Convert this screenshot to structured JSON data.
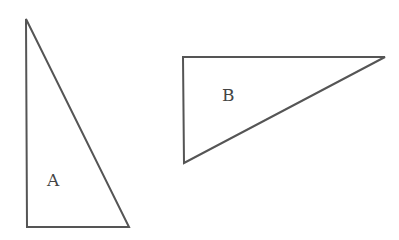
{
  "diagram": {
    "background": "#ffffff",
    "stroke_color": "#555555",
    "label_color": "#444444",
    "shapes": [
      {
        "id": "A",
        "type": "right-triangle",
        "label": "A",
        "points": "26,19 27,227 129,227",
        "label_x": 47,
        "label_y": 186
      },
      {
        "id": "B",
        "type": "right-triangle",
        "label": "B",
        "points": "183,57 385,57 184,163",
        "label_x": 222,
        "label_y": 101
      }
    ]
  }
}
